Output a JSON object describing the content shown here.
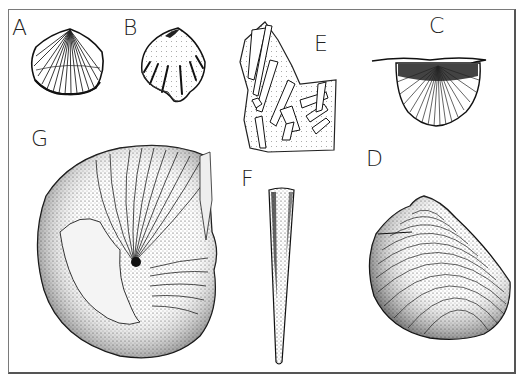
{
  "figure": {
    "labels": {
      "A": "A",
      "B": "B",
      "C": "C",
      "D": "D",
      "E": "E",
      "F": "F",
      "G": "G"
    },
    "specimens": [
      {
        "id": "A",
        "kind": "ribbed brachiopod shell"
      },
      {
        "id": "B",
        "kind": "plicate brachiopod shell"
      },
      {
        "id": "C",
        "kind": "spiriferid brachiopod with extended hinge"
      },
      {
        "id": "D",
        "kind": "concentrically ribbed bivalve shell"
      },
      {
        "id": "E",
        "kind": "rock slab with crinoid/tentaculitid fragments"
      },
      {
        "id": "F",
        "kind": "conical orthocone / tentaculitid"
      },
      {
        "id": "G",
        "kind": "coiled nautiloid / gastropod"
      }
    ],
    "colors": {
      "ink": "#1a1a1a",
      "paper": "#ffffff",
      "frame": "#6e6e6e"
    }
  }
}
